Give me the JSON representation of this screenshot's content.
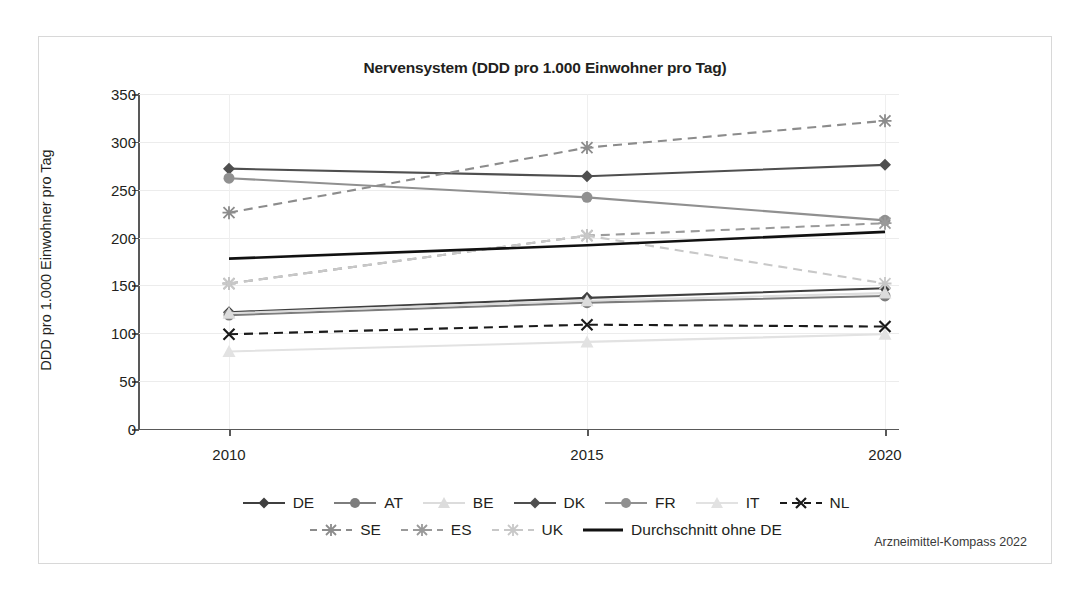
{
  "figure": {
    "source_note": "Arzneimittel-Kompass 2022"
  },
  "chart_data": {
    "type": "line",
    "title": "Nervensystem (DDD pro 1.000 Einwohner pro Tag)",
    "xlabel": "",
    "ylabel": "DDD pro 1.000 Einwohner pro Tag",
    "x": [
      "2010",
      "2015",
      "2020"
    ],
    "categories": [
      "2010",
      "2015",
      "2020"
    ],
    "ylim": [
      0,
      350
    ],
    "yticks": [
      "0",
      "50",
      "100",
      "150",
      "200",
      "250",
      "300",
      "350"
    ],
    "grid": true,
    "legend_position": "bottom",
    "series": [
      {
        "name": "DE",
        "values": [
          122,
          137,
          147
        ],
        "color": "#3f3f3f",
        "style": "solid",
        "marker": "diamond"
      },
      {
        "name": "AT",
        "values": [
          119,
          132,
          139
        ],
        "color": "#7d7d7d",
        "style": "solid",
        "marker": "circle"
      },
      {
        "name": "BE",
        "values": [
          121,
          134,
          142
        ],
        "color": "#dcdcdc",
        "style": "solid",
        "marker": "triangle"
      },
      {
        "name": "DK",
        "values": [
          272,
          264,
          276
        ],
        "color": "#4f4f4f",
        "style": "solid",
        "marker": "diamond"
      },
      {
        "name": "FR",
        "values": [
          262,
          242,
          218
        ],
        "color": "#909090",
        "style": "solid",
        "marker": "circle"
      },
      {
        "name": "IT",
        "values": [
          81,
          91,
          99
        ],
        "color": "#e2e2e2",
        "style": "solid",
        "marker": "triangle"
      },
      {
        "name": "NL",
        "values": [
          99,
          109,
          107
        ],
        "color": "#1a1a1a",
        "style": "dashed",
        "marker": "x"
      },
      {
        "name": "SE",
        "values": [
          226,
          294,
          322
        ],
        "color": "#8c8c8c",
        "style": "dashed",
        "marker": "asterisk"
      },
      {
        "name": "ES",
        "values": [
          152,
          202,
          215
        ],
        "color": "#9a9a9a",
        "style": "dashed",
        "marker": "asterisk"
      },
      {
        "name": "UK",
        "values": [
          152,
          202,
          152
        ],
        "color": "#c8c8c8",
        "style": "dashed",
        "marker": "asterisk"
      },
      {
        "name": "Durchschnitt ohne DE",
        "values": [
          178,
          192,
          206
        ],
        "color": "#111111",
        "style": "solid",
        "marker": "none"
      }
    ],
    "legend_rows": [
      [
        "DE",
        "AT",
        "BE",
        "DK",
        "FR",
        "IT",
        "NL"
      ],
      [
        "SE",
        "ES",
        "UK",
        "Durchschnitt ohne DE"
      ]
    ]
  }
}
